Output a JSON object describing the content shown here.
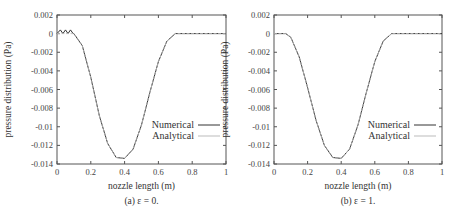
{
  "chart_data": [
    {
      "type": "line",
      "id": "a",
      "caption": "(a) ε = 0.",
      "xlabel": "nozzle length (m)",
      "ylabel": "pressure distribution (Pa)",
      "xlim": [
        0,
        1
      ],
      "ylim": [
        -0.014,
        0.002
      ],
      "xticks": [
        "0",
        "0.2",
        "0.4",
        "0.6",
        "0.8",
        "1"
      ],
      "yticks": [
        "0.002",
        "0",
        "-0.002",
        "-0.004",
        "-0.006",
        "-0.008",
        "-0.01",
        "-0.012",
        "-0.014"
      ],
      "grid": false,
      "legend_position": "lower right",
      "series": [
        {
          "name": "Numerical",
          "color": "#333333",
          "note": "small oscillations near 0 for x in [0, 0.1]",
          "x": [
            0,
            0.02,
            0.035,
            0.05,
            0.065,
            0.08,
            0.095,
            0.1,
            0.15,
            0.2,
            0.25,
            0.3,
            0.35,
            0.4,
            0.45,
            0.5,
            0.55,
            0.6,
            0.65,
            0.7,
            0.8,
            0.9,
            1.0
          ],
          "y": [
            0,
            0.0004,
            0,
            0.0004,
            0,
            0.0004,
            0,
            0,
            -0.0013,
            -0.0047,
            -0.0088,
            -0.0118,
            -0.0133,
            -0.0134,
            -0.0124,
            -0.0098,
            -0.0063,
            -0.003,
            -0.0008,
            0,
            0,
            0,
            0
          ]
        },
        {
          "name": "Analytical",
          "color": "#bbbbbb",
          "x": [
            0,
            0.1,
            0.15,
            0.2,
            0.25,
            0.3,
            0.35,
            0.4,
            0.45,
            0.5,
            0.55,
            0.6,
            0.65,
            0.7,
            0.8,
            0.9,
            1.0
          ],
          "y": [
            0,
            0,
            -0.0013,
            -0.0047,
            -0.0088,
            -0.0118,
            -0.0133,
            -0.0134,
            -0.0124,
            -0.0098,
            -0.0063,
            -0.003,
            -0.0008,
            0,
            0,
            0,
            0
          ]
        }
      ]
    },
    {
      "type": "line",
      "id": "b",
      "caption": "(b) ε = 1.",
      "xlabel": "nozzle length (m)",
      "ylabel": "pressure distribution (Pa)",
      "xlim": [
        0,
        1
      ],
      "ylim": [
        -0.014,
        0.002
      ],
      "xticks": [
        "0",
        "0.2",
        "0.4",
        "0.6",
        "0.8",
        "1"
      ],
      "yticks": [
        "0.002",
        "0",
        "-0.002",
        "-0.004",
        "-0.006",
        "-0.008",
        "-0.01",
        "-0.012",
        "-0.014"
      ],
      "grid": false,
      "legend_position": "lower right",
      "series": [
        {
          "name": "Numerical",
          "color": "#333333",
          "x": [
            0,
            0.07,
            0.1,
            0.15,
            0.2,
            0.25,
            0.3,
            0.35,
            0.4,
            0.45,
            0.5,
            0.55,
            0.6,
            0.65,
            0.7,
            0.8,
            0.9,
            1.0
          ],
          "y": [
            0,
            0,
            -0.0004,
            -0.0025,
            -0.0058,
            -0.0093,
            -0.012,
            -0.0133,
            -0.0134,
            -0.0124,
            -0.0098,
            -0.0063,
            -0.003,
            -0.0008,
            0,
            0,
            0,
            0
          ]
        },
        {
          "name": "Analytical",
          "color": "#bbbbbb",
          "x": [
            0,
            0.07,
            0.1,
            0.15,
            0.2,
            0.25,
            0.3,
            0.35,
            0.4,
            0.45,
            0.5,
            0.55,
            0.6,
            0.65,
            0.7,
            0.8,
            0.9,
            1.0
          ],
          "y": [
            0,
            0,
            -0.0004,
            -0.0025,
            -0.0058,
            -0.0093,
            -0.012,
            -0.0133,
            -0.0134,
            -0.0124,
            -0.0098,
            -0.0063,
            -0.003,
            -0.0008,
            0,
            0,
            0,
            0
          ]
        }
      ]
    }
  ],
  "panels": [
    {
      "caption": "(a) ε = 0.",
      "xlabel": "nozzle length (m)",
      "ylabel": "pressure distribution (Pa)",
      "legend": [
        "Numerical",
        "Analytical"
      ],
      "xticks": [
        "0",
        "0.2",
        "0.4",
        "0.6",
        "0.8",
        "1"
      ],
      "yticks": [
        "0.002",
        "0",
        "-0.002",
        "-0.004",
        "-0.006",
        "-0.008",
        "-0.01",
        "-0.012",
        "-0.014"
      ]
    },
    {
      "caption": "(b) ε = 1.",
      "xlabel": "nozzle length (m)",
      "ylabel": "pressure distribution (Pa)",
      "legend": [
        "Numerical",
        "Analytical"
      ],
      "xticks": [
        "0",
        "0.2",
        "0.4",
        "0.6",
        "0.8",
        "1"
      ],
      "yticks": [
        "0.002",
        "0",
        "-0.002",
        "-0.004",
        "-0.006",
        "-0.008",
        "-0.01",
        "-0.012",
        "-0.014"
      ]
    }
  ],
  "colors": {
    "frame": "#555555",
    "numerical": "#333333",
    "analytical": "#bbbbbb"
  }
}
